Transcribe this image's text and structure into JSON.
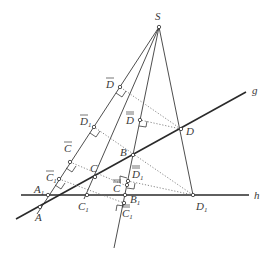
{
  "figure": {
    "lines": [
      {
        "name": "g",
        "label": "g"
      },
      {
        "name": "h",
        "label": "h"
      }
    ],
    "points": {
      "S": {
        "label": "S"
      },
      "A": {
        "label": "A"
      },
      "A1": {
        "label": "A",
        "sub": "1"
      },
      "B": {
        "label": "B"
      },
      "B1": {
        "label": "B",
        "sub": "1"
      },
      "C": {
        "label": "C"
      },
      "C1": {
        "label": "C",
        "sub": "1"
      },
      "D": {
        "label": "D"
      },
      "D1": {
        "label": "D",
        "sub": "1"
      },
      "Cbar": {
        "label": "C",
        "bar": 1
      },
      "C1bar": {
        "label": "C",
        "sub": "1",
        "bar": 1
      },
      "Dbar": {
        "label": "D",
        "bar": 1
      },
      "D1bar": {
        "label": "D",
        "sub": "1",
        "bar": 1
      },
      "Cdbar": {
        "label": "C",
        "bar": 2
      },
      "C1dbar": {
        "label": "C",
        "sub": "1",
        "bar": 2
      },
      "Ddbar": {
        "label": "D",
        "bar": 2
      },
      "D1dbar": {
        "label": "D",
        "sub": "1",
        "bar": 2
      }
    }
  }
}
